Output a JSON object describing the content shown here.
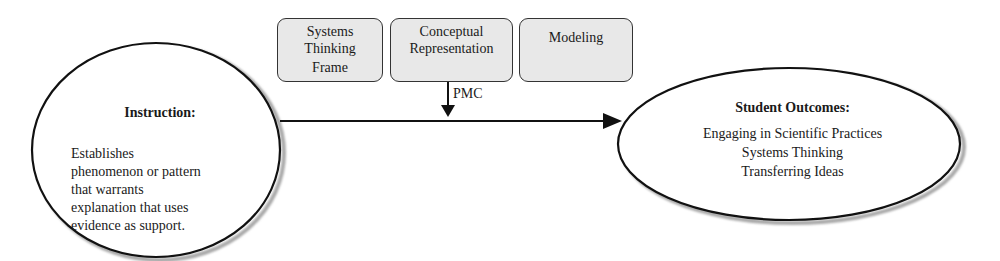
{
  "diagram": {
    "boxes": [
      {
        "id": "systems-thinking-frame",
        "lines": [
          "Systems",
          "Thinking",
          "Frame"
        ]
      },
      {
        "id": "conceptual-representation",
        "lines": [
          "Conceptual",
          "Representation"
        ]
      },
      {
        "id": "modeling",
        "lines": [
          "Modeling"
        ]
      }
    ],
    "connector_label": "PMC",
    "instruction": {
      "title": "Instruction:",
      "body_lines": [
        "Establishes",
        "phenomenon or pattern",
        "that warrants",
        "explanation that uses",
        "evidence as support."
      ]
    },
    "outcomes": {
      "title": "Student Outcomes:",
      "items": [
        "Engaging in Scientific Practices",
        "Systems Thinking",
        "Transferring Ideas"
      ]
    },
    "colors": {
      "box_fill": "#e8e8e8",
      "stroke": "#111111",
      "shadow": "#a8a8a8"
    }
  }
}
